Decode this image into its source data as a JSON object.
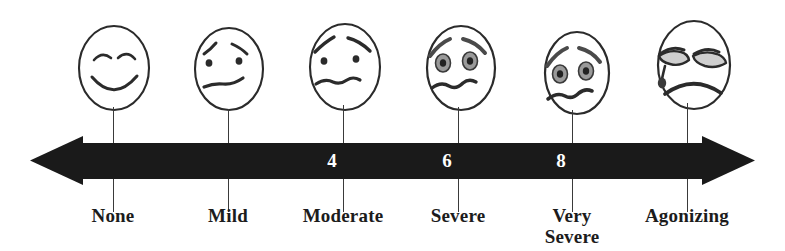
{
  "figure": {
    "name": "pain-intensity-scale",
    "background_color": "#ffffff",
    "ink_color": "#1c1c1c",
    "bar_color": "#1a1a1a",
    "number_color": "#ffffff"
  },
  "scale": {
    "axis": {
      "type": "double-headed-arrow",
      "left_arrow": "arrow-left",
      "right_arrow": "arrow-right"
    },
    "numbers": [
      {
        "value": "4",
        "x": 332
      },
      {
        "value": "6",
        "x": 447
      },
      {
        "value": "8",
        "x": 561
      }
    ],
    "points": [
      {
        "label": "None",
        "label_line_2": "",
        "tick_x": 113,
        "face": "happy-face",
        "face_description": "smiling face with curved closed eyes"
      },
      {
        "label": "Mild",
        "label_line_2": "",
        "tick_x": 228,
        "face": "mild-discomfort-face",
        "face_description": "dot eyes with slanted brows and slightly downturned mouth"
      },
      {
        "label": "Moderate",
        "label_line_2": "",
        "tick_x": 343,
        "face": "moderate-pain-face",
        "face_description": "dot eyes with raised brows and wavy mouth"
      },
      {
        "label": "Severe",
        "label_line_2": "",
        "tick_x": 458,
        "face": "severe-pain-face",
        "face_description": "shaded oval eyes with brows and wavy frown"
      },
      {
        "label": "Very",
        "label_line_2": "Severe",
        "tick_x": 572,
        "face": "very-severe-pain-face",
        "face_description": "shaded oval eyes with heavy brows and downturned wavy mouth"
      },
      {
        "label": "Agonizing",
        "label_line_2": "",
        "tick_x": 687,
        "face": "agonizing-pain-face",
        "face_description": "closed droopy eyes with a tear and deep frown"
      }
    ]
  }
}
